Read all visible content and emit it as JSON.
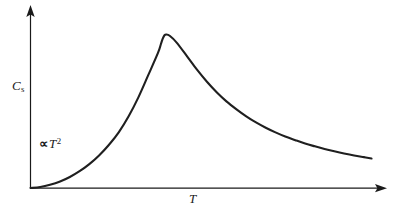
{
  "figure": {
    "background_color": "#ffffff",
    "curve_color": "#1f1f1f",
    "axis_color": "#1a1a1a"
  },
  "axes": {
    "y_axis_name": "vertical-axis",
    "x_axis_name": "horizontal-axis",
    "y_label_symbol": "C",
    "y_label_subscript": "s",
    "x_label_symbol": "T"
  },
  "annotation": {
    "proportional_sign": "∝",
    "variable": "T",
    "exponent": "2"
  },
  "chart_data": {
    "type": "line",
    "title": "",
    "subtitle": "",
    "xlabel": "T",
    "ylabel": "C_s",
    "grid": false,
    "legend": null,
    "xlim": [
      0,
      1
    ],
    "ylim": [
      0,
      1
    ],
    "tick_labels": {
      "x": [],
      "y": []
    },
    "annotations": [
      {
        "text": "∝ T^2",
        "x": 0.05,
        "y": 0.24,
        "description": "low-temperature limiting behaviour proportional to T squared"
      }
    ],
    "series": [
      {
        "name": "specific heat",
        "x": [
          0.0,
          0.028,
          0.056,
          0.085,
          0.113,
          0.141,
          0.169,
          0.197,
          0.225,
          0.254,
          0.282,
          0.31,
          0.338,
          0.366,
          0.375,
          0.38,
          0.385,
          0.39,
          0.4,
          0.42,
          0.451,
          0.479,
          0.507,
          0.535,
          0.563,
          0.592,
          0.62,
          0.648,
          0.676,
          0.704,
          0.732,
          0.761,
          0.789,
          0.817,
          0.845,
          0.873,
          0.901,
          0.93,
          0.958,
          0.98
        ],
        "y": [
          0.0,
          0.006,
          0.019,
          0.039,
          0.066,
          0.101,
          0.144,
          0.196,
          0.259,
          0.337,
          0.432,
          0.546,
          0.678,
          0.812,
          0.869,
          0.9,
          0.92,
          0.925,
          0.917,
          0.876,
          0.79,
          0.711,
          0.64,
          0.577,
          0.522,
          0.474,
          0.432,
          0.395,
          0.363,
          0.335,
          0.31,
          0.288,
          0.268,
          0.251,
          0.235,
          0.221,
          0.208,
          0.196,
          0.186,
          0.178
        ]
      }
    ]
  }
}
